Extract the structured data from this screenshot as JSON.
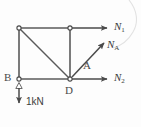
{
  "figure": {
    "type": "free-body-diagram",
    "background_color": "#fdfdfd",
    "line_color": "#555555",
    "text_color": "#3a3a3a"
  },
  "nodes": [
    {
      "id": "top-left",
      "label": "",
      "x": 19,
      "y": 28
    },
    {
      "id": "top-middle",
      "label": "",
      "x": 70,
      "y": 28
    },
    {
      "id": "B",
      "label": "B",
      "x": 19,
      "y": 79
    },
    {
      "id": "D",
      "label": "D",
      "x": 70,
      "y": 79
    }
  ],
  "point_labels": {
    "B": "B",
    "D": "D",
    "A": "A"
  },
  "forces": [
    {
      "id": "N1",
      "symbol": "N",
      "subscript": "1",
      "label": "N1",
      "direction": "right",
      "origin": "top-middle"
    },
    {
      "id": "NA",
      "symbol": "N",
      "subscript": "A",
      "label": "NA",
      "direction": "up-right",
      "origin": "D"
    },
    {
      "id": "N2",
      "symbol": "N",
      "subscript": "2",
      "label": "N2",
      "direction": "right",
      "origin": "D"
    }
  ],
  "load": {
    "id": "applied-load",
    "magnitude": "1kN",
    "direction": "down",
    "origin": "B"
  },
  "members": [
    {
      "id": "top-beam",
      "from": "top-left",
      "to": "top-middle"
    },
    {
      "id": "left-column",
      "from": "top-left",
      "to": "B"
    },
    {
      "id": "bottom-beam",
      "from": "B",
      "to": "D"
    },
    {
      "id": "vertical-member",
      "from": "top-middle",
      "to": "D"
    },
    {
      "id": "diagonal-member",
      "from": "top-left",
      "to": "D"
    }
  ]
}
